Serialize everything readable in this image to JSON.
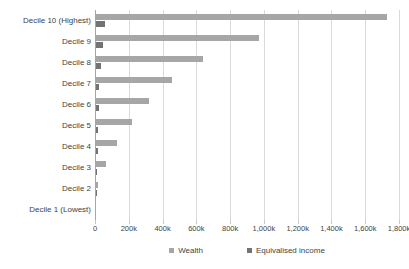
{
  "chart_data": {
    "type": "bar",
    "orientation": "horizontal",
    "title": "",
    "subtitle": "",
    "xlabel": "",
    "ylabel": "",
    "xlim": [
      0,
      1800000
    ],
    "xtick_labels": [
      "0",
      "200k",
      "400k",
      "600k",
      "800k",
      "1,000k",
      "1,200k",
      "1,400k",
      "1,600k",
      "1,800k"
    ],
    "xtick_values": [
      0,
      200000,
      400000,
      600000,
      800000,
      1000000,
      1200000,
      1400000,
      1600000,
      1800000
    ],
    "grid": true,
    "legend_position": "bottom",
    "categories": [
      "Decile 10 (Highest)",
      "Decile 9",
      "Decile 8",
      "Decile 7",
      "Decile 6",
      "Decile 5",
      "Decile 4",
      "Decile 3",
      "Decile 2",
      "Decile 1 (Lowest)"
    ],
    "series": [
      {
        "name": "Wealth",
        "color": "#a6a6a6",
        "values": [
          1730000,
          970000,
          640000,
          456000,
          317000,
          219000,
          133000,
          67000,
          15000,
          3000
        ]
      },
      {
        "name": "Equivalised income",
        "color": "#737373",
        "values": [
          62000,
          46000,
          36000,
          26000,
          21000,
          17000,
          15000,
          12000,
          10000,
          4000
        ]
      }
    ]
  },
  "legend": {
    "items": [
      {
        "label": "Wealth",
        "swatch": "wealth"
      },
      {
        "label": "Equivalised income",
        "swatch": "income"
      }
    ]
  }
}
